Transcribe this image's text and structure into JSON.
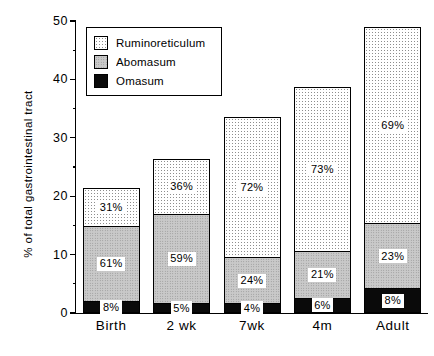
{
  "chart_data": {
    "type": "bar",
    "stacked": true,
    "title": "",
    "xlabel": "",
    "ylabel": "% of total gastrointestinal tract",
    "ylim": [
      0,
      50
    ],
    "yticks": [
      0,
      10,
      20,
      30,
      40,
      50
    ],
    "yticks_minor": [
      5,
      15,
      25,
      35,
      45
    ],
    "grid": false,
    "legend_position": "top-left",
    "categories": [
      "Birth",
      "2 wk",
      "7wk",
      "4m",
      "Adult"
    ],
    "totals": [
      21.4,
      26.4,
      33.5,
      38.7,
      49.0
    ],
    "series": [
      {
        "name": "Omasum",
        "color": "#0a0a0a",
        "values": [
          1.7,
          1.3,
          1.3,
          2.3,
          3.9
        ],
        "labels": [
          "8%",
          "5%",
          "4%",
          "6%",
          "8%"
        ]
      },
      {
        "name": "Abomasum",
        "color": "#c9c9c9",
        "values": [
          13.1,
          15.6,
          8.0,
          8.1,
          11.3
        ],
        "labels": [
          "61%",
          "59%",
          "24%",
          "21%",
          "23%"
        ]
      },
      {
        "name": "Ruminoreticulum",
        "color": "#ffffff",
        "values": [
          6.6,
          9.5,
          24.2,
          28.3,
          33.8
        ],
        "labels": [
          "31%",
          "36%",
          "72%",
          "73%",
          "69%"
        ]
      }
    ]
  },
  "legend": {
    "items": [
      {
        "label": "Ruminoreticulum",
        "swatch": "rumino"
      },
      {
        "label": "Abomasum",
        "swatch": "abomasum"
      },
      {
        "label": "Omasum",
        "swatch": "omasum"
      }
    ]
  },
  "yaxis": {
    "title": "% of total gastrointestinal tract",
    "tick_labels": [
      "0",
      "10",
      "20",
      "30",
      "40",
      "50"
    ]
  },
  "xaxis": {
    "tick_labels": [
      "Birth",
      "2 wk",
      "7wk",
      "4m",
      "Adult"
    ]
  }
}
